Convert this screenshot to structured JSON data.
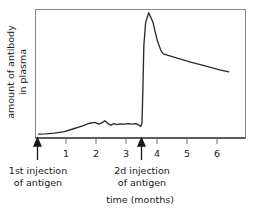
{
  "chart_data": {
    "type": "line",
    "title": "",
    "xlabel": "time (months)",
    "ylabel_lines": [
      "amount of antibody",
      "in plasma"
    ],
    "ylabel": "amount of antibody in plasma",
    "xlim": [
      0,
      6.9
    ],
    "ylim": [
      0,
      1.0
    ],
    "xticks": [
      1,
      2,
      3,
      4,
      5,
      6
    ],
    "xtick_labels": [
      "1",
      "2",
      "3",
      "4",
      "5",
      "6"
    ],
    "yticks": [],
    "ytick_labels": [],
    "grid": false,
    "legend": null,
    "series": [
      {
        "name": "antibody in plasma",
        "x": [
          0.1,
          0.35,
          0.62,
          0.95,
          1.25,
          1.55,
          1.78,
          1.95,
          2.08,
          2.18,
          2.28,
          2.38,
          2.48,
          2.58,
          2.68,
          2.78,
          2.92,
          3.05,
          3.18,
          3.3,
          3.4,
          3.46,
          3.5,
          3.53,
          3.56,
          3.62,
          3.72,
          3.86,
          4.0,
          4.12,
          4.2,
          4.6,
          5.1,
          5.6,
          6.05,
          6.35
        ],
        "y": [
          0.03,
          0.032,
          0.038,
          0.05,
          0.072,
          0.095,
          0.115,
          0.122,
          0.108,
          0.118,
          0.134,
          0.112,
          0.1,
          0.112,
          0.104,
          0.11,
          0.108,
          0.112,
          0.108,
          0.112,
          0.1,
          0.09,
          0.12,
          0.4,
          0.72,
          0.9,
          0.975,
          0.9,
          0.76,
          0.68,
          0.655,
          0.625,
          0.59,
          0.56,
          0.53,
          0.515
        ]
      }
    ],
    "annotations": [
      {
        "id": "first-injection",
        "lines": [
          "1st injection",
          "of antigen"
        ],
        "x_value": 0.18,
        "marker": "up-arrow"
      },
      {
        "id": "second-injection",
        "lines": [
          "2d injection",
          "of antigen"
        ],
        "x_value": 3.5,
        "marker": "up-arrow"
      }
    ]
  },
  "figure": {
    "background_color": "#ffffff",
    "curve_color": "#2b2b2b",
    "frame_color": "#8a8a8a",
    "text_color": "#1a1a1a"
  }
}
